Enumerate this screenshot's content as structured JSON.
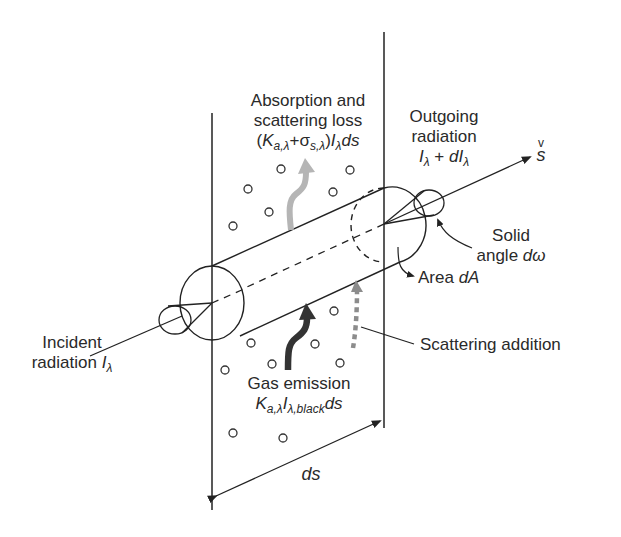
{
  "diagram": {
    "labels": {
      "absorption": {
        "line1": "Absorption and",
        "line2": "scattering loss",
        "formula_open": "(",
        "formula_K": "K",
        "formula_K_sub": "a,λ",
        "formula_plus": "+",
        "formula_sigma": "σ",
        "formula_sigma_sub": "s,λ",
        "formula_close": ")",
        "formula_I": "I",
        "formula_I_sub": "λ",
        "formula_ds": "ds"
      },
      "outgoing": {
        "line1": "Outgoing",
        "line2": "radiation",
        "formula_I": "I",
        "formula_I_sub": "λ",
        "formula_plus": " + ",
        "formula_dI": "dI",
        "formula_dI_sub": "λ"
      },
      "direction": {
        "vec": "v",
        "s": "s"
      },
      "solid_angle": {
        "line1": "Solid",
        "line2_text": "angle ",
        "line2_sym": "dω"
      },
      "area": {
        "text": "Area ",
        "sym": "dA"
      },
      "incident": {
        "line1": "Incident",
        "line2_text": "radiation ",
        "sym": "I",
        "sub": "λ"
      },
      "scattering_addition": {
        "text": "Scattering addition"
      },
      "gas_emission": {
        "line1": "Gas emission",
        "formula_K": "K",
        "formula_K_sub": "a,λ",
        "formula_I": "I",
        "formula_I_sub": "λ,black",
        "formula_ds": "ds"
      },
      "thickness": {
        "text": "ds"
      }
    },
    "colors": {
      "line": "#222222",
      "absorption_arrow": "#b5b5b5",
      "emission_arrow": "#333333",
      "scattering_arrow": "#8c8c8c"
    }
  }
}
